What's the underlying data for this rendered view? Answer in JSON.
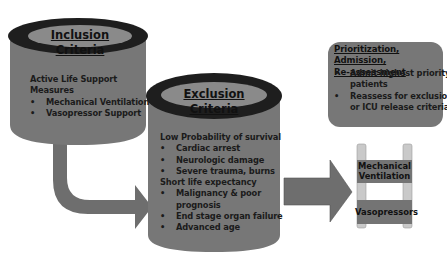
{
  "diagram": {
    "colors": {
      "cylinder_body": "#777777",
      "cylinder_top_ring": "#1e1e1e",
      "cylinder_top_inner": "#8a8a8a",
      "arrow": "#6e6e6e",
      "box": "#777777",
      "ladder_rail": "#c9c9c9",
      "ladder_rung": "#747474"
    },
    "inclusion": {
      "title": "Inclusion Criteria",
      "heading": "Active Life Support Measures",
      "heading_line1": "Active Life Support",
      "heading_line2": "Measures",
      "items": [
        "Mechanical Ventilation",
        "Vasopressor Support"
      ]
    },
    "exclusion": {
      "title": "Exclusion Criteria",
      "group1_heading": "Low Probability of survival",
      "group1_items": [
        "Cardiac arrest",
        "Neurologic damage",
        "Severe trauma, burns"
      ],
      "group2_heading": "Short life expectancy",
      "group2_items": [
        "Malignancy & poor",
        "prognosis",
        "End stage organ failure",
        "Advanced age"
      ]
    },
    "prioritization": {
      "title_line1": "Prioritization, Admission,",
      "title_line2": "Re-assessment",
      "item1_line1": "Admit highest priority",
      "item1_line2": "patients",
      "item2_line1": "Reassess for exclusion",
      "item2_line2": "or ICU release criteria"
    },
    "ladder": {
      "rung1_line1": "Mechanical",
      "rung1_line2": "Ventilation",
      "rung2": "Vasopressors"
    }
  }
}
